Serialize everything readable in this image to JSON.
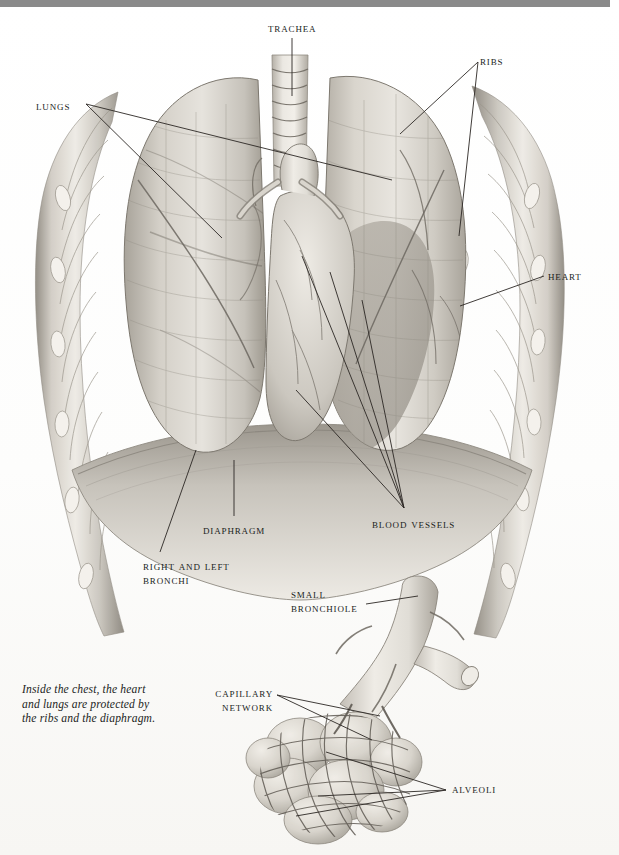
{
  "page": {
    "background_color": "#ffffff",
    "top_band_color": "#8a8a8a",
    "ink_color": "#201d1b",
    "leader_line_color": "#2b2724"
  },
  "caption": {
    "text": "Inside the chest, the heart\nand lungs are protected by\nthe ribs and the diaphragm."
  },
  "labels": [
    {
      "id": "trachea",
      "text": "Trachea",
      "x": 268,
      "y": 22,
      "align": "left"
    },
    {
      "id": "ribs",
      "text": "Ribs",
      "x": 480,
      "y": 55,
      "align": "left"
    },
    {
      "id": "lungs",
      "text": "Lungs",
      "x": 36,
      "y": 100,
      "align": "left"
    },
    {
      "id": "heart",
      "text": "Heart",
      "x": 548,
      "y": 270,
      "align": "left"
    },
    {
      "id": "diaphragm",
      "text": "Diaphragm",
      "x": 203,
      "y": 524,
      "align": "left"
    },
    {
      "id": "blood-vessels",
      "text": "Blood vessels",
      "x": 372,
      "y": 518,
      "align": "left"
    },
    {
      "id": "right-left-bronchi",
      "text": "Right and left\nbronchi",
      "x": 143,
      "y": 560,
      "align": "left"
    },
    {
      "id": "small-bronchiole",
      "text": "Small\nbronchiole",
      "x": 291,
      "y": 588,
      "align": "left"
    },
    {
      "id": "capillary-network",
      "text": "Capillary\nnetwork",
      "x": 273,
      "y": 687,
      "align": "right"
    },
    {
      "id": "alveoli",
      "text": "Alveoli",
      "x": 452,
      "y": 783,
      "align": "left"
    }
  ],
  "figure": {
    "name": "thorax-lungs-alveoli-illustration",
    "parts": [
      "ribcage",
      "trachea",
      "right-lung",
      "left-lung",
      "heart",
      "diaphragm",
      "bronchi",
      "small-bronchiole",
      "capillary-network",
      "alveoli"
    ]
  },
  "palette": {
    "tissue_light": "#e3e0da",
    "tissue_mid": "#c9c5bd",
    "tissue_dark": "#a7a39a",
    "rib_light": "#ded9d1",
    "rib_shadow": "#9a958c",
    "heart_shade": "#9b968d",
    "vessel_line": "#6a655d",
    "cartilage": "#efece6"
  }
}
